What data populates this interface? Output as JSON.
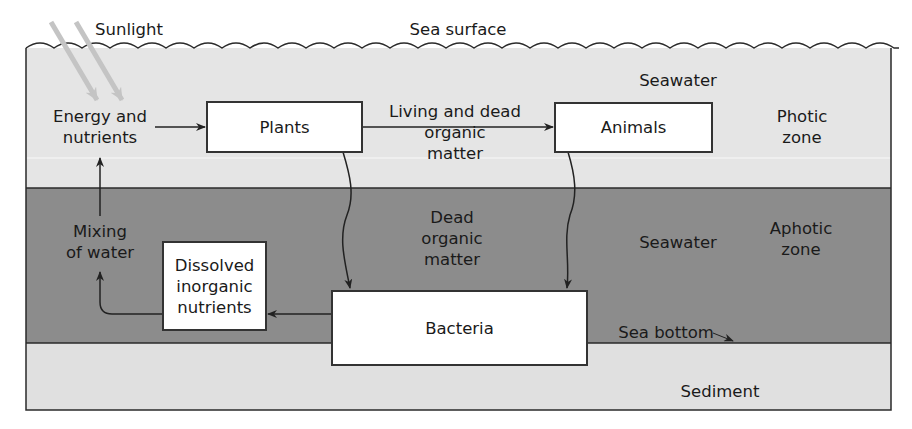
{
  "diagram": {
    "colors": {
      "photic_zone": "#e5e5e5",
      "aphotic_zone": "#8c8c8c",
      "sediment": "#e0e0e0",
      "line": "#2a2a2a",
      "sunlight": "#c8c8c8"
    },
    "labels": {
      "sunlight": "Sunlight",
      "sea_surface": "Sea surface",
      "seawater_top": "Seawater",
      "photic_zone": "Photic\nzone",
      "energy_nutrients": "Energy and\nnutrients",
      "living_dead": "Living and dead\norganic\nmatter",
      "mixing": "Mixing\nof water",
      "dead_organic": "Dead\norganic\nmatter",
      "seawater_bottom": "Seawater",
      "aphotic_zone": "Aphotic\nzone",
      "sea_bottom": "Sea bottom",
      "sediment": "Sediment"
    },
    "boxes": {
      "plants": "Plants",
      "animals": "Animals",
      "dissolved": "Dissolved\ninorganic\nnutrients",
      "bacteria": "Bacteria"
    },
    "zones": [
      "Photic zone",
      "Aphotic zone",
      "Sediment"
    ],
    "flows": [
      {
        "from": "Energy and nutrients",
        "to": "Plants"
      },
      {
        "from": "Plants",
        "to": "Animals",
        "label": "Living and dead organic matter"
      },
      {
        "from": "Plants",
        "to": "Bacteria",
        "label": "Dead organic matter"
      },
      {
        "from": "Animals",
        "to": "Bacteria",
        "label": "Dead organic matter"
      },
      {
        "from": "Bacteria",
        "to": "Dissolved inorganic nutrients"
      },
      {
        "from": "Dissolved inorganic nutrients",
        "to": "Mixing of water"
      },
      {
        "from": "Mixing of water",
        "to": "Energy and nutrients"
      },
      {
        "from": "Sunlight",
        "to": "Energy and nutrients"
      }
    ]
  }
}
